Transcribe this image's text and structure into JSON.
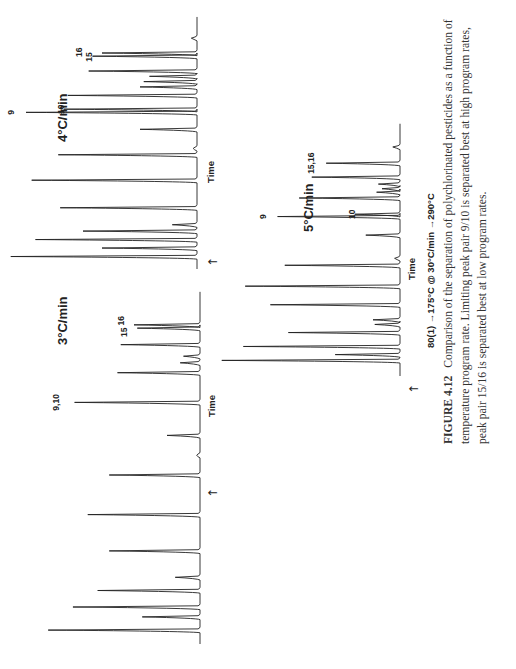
{
  "figure": {
    "number_label": "FIGURE 4.12",
    "caption_lines": [
      "Comparison of the separation of polychlorinated pesticides as a function of",
      "temperature program rate. Limiting peak pair 9/10 is separated best at high program rates,",
      "peak pair 15/16 is separated best at low program rates."
    ],
    "program_conditions": "80(1) →175°C @ 30°C/min →290°C",
    "injection_marker": "↑"
  },
  "chart_data": [
    {
      "type": "line",
      "subtype": "chromatogram",
      "title": "3°C/min",
      "xlabel": "Time",
      "ylabel": "",
      "annotations": [
        "9,10",
        "15",
        "16"
      ],
      "peaks": [
        {
          "t": 0.03,
          "h": 0.92
        },
        {
          "t": 0.07,
          "h": 0.35
        },
        {
          "t": 0.1,
          "h": 0.77
        },
        {
          "t": 0.15,
          "h": 0.62
        },
        {
          "t": 0.19,
          "h": 0.15
        },
        {
          "t": 0.27,
          "h": 0.55
        },
        {
          "t": 0.38,
          "h": 0.68
        },
        {
          "t": 0.5,
          "h": 0.55
        },
        {
          "t": 0.56,
          "h": 0.02
        },
        {
          "t": 0.62,
          "h": 0.2
        },
        {
          "t": 0.72,
          "h": 0.76,
          "label": "9,10"
        },
        {
          "t": 0.81,
          "h": 0.5
        },
        {
          "t": 0.84,
          "h": 0.12
        },
        {
          "t": 0.86,
          "h": 0.1
        },
        {
          "t": 0.895,
          "h": 0.48
        },
        {
          "t": 0.945,
          "h": 0.38,
          "label": "15"
        },
        {
          "t": 0.955,
          "h": 0.4,
          "label": "16"
        }
      ]
    },
    {
      "type": "line",
      "subtype": "chromatogram",
      "title": "4°C/min",
      "xlabel": "Time",
      "ylabel": "",
      "annotations": [
        "9",
        "10",
        "15",
        "16"
      ],
      "peaks": [
        {
          "t": 0.04,
          "h": 0.98
        },
        {
          "t": 0.08,
          "h": 0.5
        },
        {
          "t": 0.12,
          "h": 0.85
        },
        {
          "t": 0.16,
          "h": 0.6
        },
        {
          "t": 0.19,
          "h": 0.13
        },
        {
          "t": 0.27,
          "h": 0.72
        },
        {
          "t": 0.4,
          "h": 0.87
        },
        {
          "t": 0.52,
          "h": 0.73
        },
        {
          "t": 0.55,
          "h": 0.02
        },
        {
          "t": 0.64,
          "h": 0.3
        },
        {
          "t": 0.72,
          "h": 0.9,
          "label": "9"
        },
        {
          "t": 0.735,
          "h": 0.7,
          "label": "10"
        },
        {
          "t": 0.8,
          "h": 0.68
        },
        {
          "t": 0.84,
          "h": 0.3
        },
        {
          "t": 0.865,
          "h": 0.28
        },
        {
          "t": 0.89,
          "h": 0.25
        },
        {
          "t": 0.915,
          "h": 0.57
        },
        {
          "t": 0.985,
          "h": 0.55,
          "label": "16"
        },
        {
          "t": 1.0,
          "h": 0.5,
          "label": "15"
        },
        {
          "t": 1.07,
          "h": 0.03
        }
      ]
    },
    {
      "type": "line",
      "subtype": "chromatogram",
      "title": "5°C/min",
      "xlabel": "Time",
      "ylabel": "",
      "annotations": [
        "9",
        "10",
        "15,16"
      ],
      "peaks": [
        {
          "t": 0.05,
          "h": 0.99
        },
        {
          "t": 0.075,
          "h": 0.36
        },
        {
          "t": 0.11,
          "h": 0.87
        },
        {
          "t": 0.17,
          "h": 0.62
        },
        {
          "t": 0.205,
          "h": 0.14
        },
        {
          "t": 0.225,
          "h": 0.15
        },
        {
          "t": 0.29,
          "h": 0.72
        },
        {
          "t": 0.37,
          "h": 0.86
        },
        {
          "t": 0.46,
          "h": 0.64
        },
        {
          "t": 0.49,
          "h": 0.03
        },
        {
          "t": 0.59,
          "h": 0.19
        },
        {
          "t": 0.67,
          "h": 0.68,
          "label": "9"
        },
        {
          "t": 0.68,
          "h": 0.25,
          "label": "10"
        },
        {
          "t": 0.75,
          "h": 0.56
        },
        {
          "t": 0.775,
          "h": 0.13
        },
        {
          "t": 0.79,
          "h": 0.1
        },
        {
          "t": 0.81,
          "h": 0.12
        },
        {
          "t": 0.84,
          "h": 0.49
        },
        {
          "t": 0.9,
          "h": 0.41,
          "label": "15,16"
        },
        {
          "t": 0.97,
          "h": 0.04
        }
      ]
    }
  ]
}
